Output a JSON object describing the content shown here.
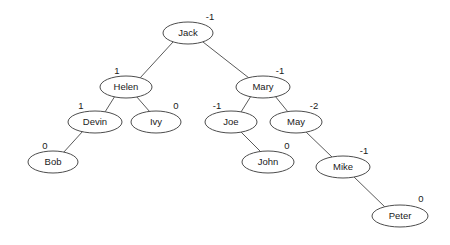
{
  "figure": {
    "type": "avl-binary-tree-diagram",
    "width": 450,
    "height": 245,
    "background_color": "#ffffff",
    "node_fill_color": "#ffffff",
    "node_stroke_color": "#4d4d4d",
    "edge_color": "#5a5a5a",
    "text_color": "#1a1a1a"
  },
  "nodes": [
    {
      "id": "jack",
      "label": "Jack",
      "balance": "-1",
      "cx": 188,
      "cy": 33,
      "rx": 25,
      "ry": 11,
      "bx": 210,
      "by": 17
    },
    {
      "id": "helen",
      "label": "Helen",
      "balance": "1",
      "cx": 126,
      "cy": 87,
      "rx": 26,
      "ry": 11,
      "bx": 117,
      "by": 71
    },
    {
      "id": "mary",
      "label": "Mary",
      "balance": "-1",
      "cx": 263,
      "cy": 87,
      "rx": 27,
      "ry": 11,
      "bx": 280,
      "by": 71
    },
    {
      "id": "devin",
      "label": "Devin",
      "balance": "1",
      "cx": 95,
      "cy": 122,
      "rx": 27,
      "ry": 11,
      "bx": 81,
      "by": 106
    },
    {
      "id": "ivy",
      "label": "Ivy",
      "balance": "0",
      "cx": 156,
      "cy": 122,
      "rx": 25,
      "ry": 11,
      "bx": 176,
      "by": 106
    },
    {
      "id": "joe",
      "label": "Joe",
      "balance": "-1",
      "cx": 231,
      "cy": 122,
      "rx": 26,
      "ry": 11,
      "bx": 217,
      "by": 106
    },
    {
      "id": "may",
      "label": "May",
      "balance": "-2",
      "cx": 296,
      "cy": 122,
      "rx": 26,
      "ry": 11,
      "bx": 314,
      "by": 106
    },
    {
      "id": "bob",
      "label": "Bob",
      "balance": "0",
      "cx": 53,
      "cy": 162,
      "rx": 25,
      "ry": 11,
      "bx": 45,
      "by": 146
    },
    {
      "id": "john",
      "label": "John",
      "balance": "0",
      "cx": 268,
      "cy": 162,
      "rx": 26,
      "ry": 11,
      "bx": 287,
      "by": 146
    },
    {
      "id": "mike",
      "label": "Mike",
      "balance": "-1",
      "cx": 343,
      "cy": 167,
      "rx": 27,
      "ry": 11,
      "bx": 364,
      "by": 151
    },
    {
      "id": "peter",
      "label": "Peter",
      "balance": "0",
      "cx": 400,
      "cy": 216,
      "rx": 28,
      "ry": 11,
      "bx": 421,
      "by": 199
    }
  ],
  "edges": [
    {
      "from": "jack",
      "to": "helen",
      "x1": 173,
      "y1": 42,
      "x2": 140,
      "y2": 78
    },
    {
      "from": "jack",
      "to": "mary",
      "x1": 203,
      "y1": 42,
      "x2": 249,
      "y2": 78
    },
    {
      "from": "helen",
      "to": "devin",
      "x1": 115,
      "y1": 96,
      "x2": 105,
      "y2": 112
    },
    {
      "from": "helen",
      "to": "ivy",
      "x1": 136,
      "y1": 96,
      "x2": 150,
      "y2": 112
    },
    {
      "from": "devin",
      "to": "bob",
      "x1": 83,
      "y1": 131,
      "x2": 63,
      "y2": 153
    },
    {
      "from": "mary",
      "to": "joe",
      "x1": 251,
      "y1": 96,
      "x2": 241,
      "y2": 112
    },
    {
      "from": "mary",
      "to": "may",
      "x1": 275,
      "y1": 96,
      "x2": 288,
      "y2": 112
    },
    {
      "from": "joe",
      "to": "john",
      "x1": 240,
      "y1": 131,
      "x2": 261,
      "y2": 152
    },
    {
      "from": "may",
      "to": "mike",
      "x1": 305,
      "y1": 131,
      "x2": 332,
      "y2": 157
    },
    {
      "from": "mike",
      "to": "peter",
      "x1": 353,
      "y1": 176,
      "x2": 386,
      "y2": 208
    }
  ]
}
